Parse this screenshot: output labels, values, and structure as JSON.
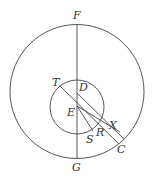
{
  "diagram": {
    "type": "geometry",
    "big_circle": {
      "cx": 77,
      "cy": 91.5,
      "r": 67
    },
    "small_circle": {
      "cx": 77,
      "cy": 107,
      "r": 27
    },
    "labels": {
      "F": "F",
      "G": "G",
      "T": "T",
      "D": "D",
      "E": "E",
      "S": "S",
      "R": "R",
      "X": "X",
      "C": "C"
    }
  }
}
